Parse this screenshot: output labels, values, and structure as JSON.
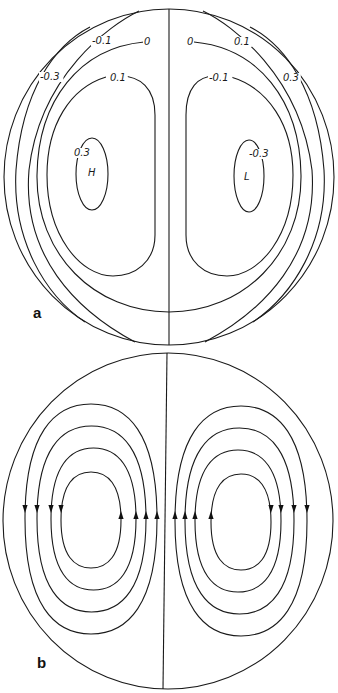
{
  "figure": {
    "panels": [
      {
        "id": "a",
        "label": "a",
        "label_pos": [
          33,
          318
        ],
        "circle": {
          "cx": 169,
          "cy": 177,
          "rx": 165,
          "ry": 168
        },
        "axis_line": {
          "x1": 169,
          "y1": 9,
          "x2": 169,
          "y2": 345
        },
        "contours": [
          {
            "value": "-0.3",
            "side": "left"
          },
          {
            "value": "-0.1",
            "side": "left"
          },
          {
            "value": "0",
            "side": "both"
          },
          {
            "value": "0.1",
            "side": "left"
          },
          {
            "value": "0.3",
            "side": "left"
          },
          {
            "value": "0.3",
            "side": "right"
          },
          {
            "value": "0.1",
            "side": "right"
          },
          {
            "value": "-0.1",
            "side": "right"
          },
          {
            "value": "-0.3",
            "side": "right"
          }
        ],
        "labels": [
          {
            "text": "-0.1",
            "x": 92,
            "y": 44
          },
          {
            "text": "0",
            "x": 144,
            "y": 45
          },
          {
            "text": "0",
            "x": 187,
            "y": 45
          },
          {
            "text": "0.1",
            "x": 234,
            "y": 45
          },
          {
            "text": "-0.3",
            "x": 40,
            "y": 80
          },
          {
            "text": "0.1",
            "x": 110,
            "y": 81
          },
          {
            "text": "-0.1",
            "x": 209,
            "y": 81
          },
          {
            "text": "0.3",
            "x": 283,
            "y": 81
          },
          {
            "text": "0.3",
            "x": 74,
            "y": 156
          },
          {
            "text": "-0.3",
            "x": 249,
            "y": 157
          }
        ],
        "extrema": [
          {
            "text": "H",
            "x": 88,
            "y": 176
          },
          {
            "text": "L",
            "x": 244,
            "y": 180
          }
        ]
      },
      {
        "id": "b",
        "label": "b",
        "label_pos": [
          37,
          668
        ],
        "circle": {
          "cx": 168,
          "cy": 521,
          "rx": 165,
          "ry": 168
        },
        "axis_line": {
          "x1": 167,
          "y1": 353,
          "x2": 163,
          "y2": 689
        },
        "streamlines": {
          "left_cell": [
            {
              "top": 404,
              "bottom": 634,
              "left": 25,
              "right": 157
            },
            {
              "top": 426,
              "bottom": 612,
              "left": 37,
              "right": 146
            },
            {
              "top": 448,
              "bottom": 590,
              "left": 51,
              "right": 136
            },
            {
              "top": 472,
              "bottom": 568,
              "left": 61,
              "right": 121
            }
          ],
          "right_cell": [
            {
              "top": 406,
              "bottom": 636,
              "left": 175,
              "right": 307
            },
            {
              "top": 428,
              "bottom": 614,
              "left": 185,
              "right": 294
            },
            {
              "top": 450,
              "bottom": 592,
              "left": 195,
              "right": 281
            },
            {
              "top": 474,
              "bottom": 570,
              "left": 211,
              "right": 271
            }
          ],
          "arrow_y": 512,
          "left_cell_direction": "counterclockwise",
          "right_cell_direction": "clockwise"
        }
      }
    ]
  }
}
